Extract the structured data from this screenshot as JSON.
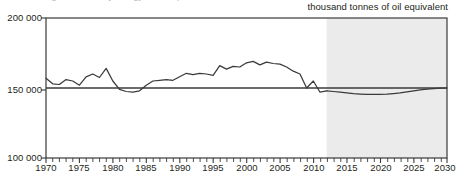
{
  "figure": {
    "title_cutoff": "Figure 1: Primary energy consumption, 1970 to 2030",
    "unit_caption": "thousand tonnes of oil equivalent",
    "projection_label": "future projections"
  },
  "chart_data": {
    "type": "line",
    "title": "",
    "xlabel": "",
    "ylabel": "thousand tonnes of oil equivalent",
    "xlim": [
      1970,
      2030
    ],
    "ylim": [
      100000,
      200000
    ],
    "yticks": [
      100000,
      150000,
      200000
    ],
    "ytick_labels": [
      "100 000",
      "150 000",
      "200 000"
    ],
    "xticks": [
      1970,
      1975,
      1980,
      1985,
      1990,
      1995,
      2000,
      2005,
      2010,
      2015,
      2020,
      2025,
      2030
    ],
    "xtick_labels": [
      "1970",
      "1975",
      "1980",
      "1985",
      "1990",
      "1995",
      "2000",
      "2005",
      "2010",
      "2015",
      "2020",
      "2025",
      "2030"
    ],
    "minor_xtick_interval": 1,
    "grid": false,
    "reference_line": 150000,
    "legend": "none",
    "annotations": [
      {
        "text": "future projections",
        "x": 2021,
        "y": 186000
      },
      {
        "text": "thousand tonnes of oil equivalent",
        "x": 2030,
        "y": 202000
      }
    ],
    "shaded_regions": [
      {
        "label": "future projections",
        "x_start": 2012,
        "x_end": 2030,
        "color": "#ebebeb"
      }
    ],
    "series": [
      {
        "name": "Primary energy consumption",
        "color": "#3a3a3a",
        "style": "solid",
        "x": [
          1970,
          1971,
          1972,
          1973,
          1974,
          1975,
          1976,
          1977,
          1978,
          1979,
          1980,
          1981,
          1982,
          1983,
          1984,
          1985,
          1986,
          1987,
          1988,
          1989,
          1990,
          1991,
          1992,
          1993,
          1994,
          1995,
          1996,
          1997,
          1998,
          1999,
          2000,
          2001,
          2002,
          2003,
          2004,
          2005,
          2006,
          2007,
          2008,
          2009,
          2010,
          2011,
          2012
        ],
        "values": [
          157000,
          153000,
          152500,
          156000,
          155000,
          152000,
          158000,
          160000,
          157500,
          164000,
          155000,
          149000,
          147500,
          147000,
          148000,
          152000,
          155000,
          155500,
          156000,
          155500,
          158000,
          160500,
          159500,
          160500,
          160000,
          159000,
          166000,
          163500,
          165500,
          165000,
          168000,
          169000,
          166500,
          168500,
          167500,
          167000,
          165000,
          162000,
          160000,
          150000,
          155000,
          147000,
          148000
        ]
      },
      {
        "name": "Projection",
        "color": "#3a3a3a",
        "style": "solid",
        "x": [
          2012,
          2013,
          2014,
          2015,
          2016,
          2017,
          2018,
          2019,
          2020,
          2021,
          2022,
          2023,
          2024,
          2025,
          2026,
          2027,
          2028,
          2029,
          2030
        ],
        "values": [
          148000,
          147500,
          147000,
          146500,
          146000,
          145700,
          145500,
          145400,
          145400,
          145600,
          146000,
          146500,
          147200,
          148000,
          148700,
          149200,
          149600,
          149900,
          150000
        ]
      }
    ]
  }
}
